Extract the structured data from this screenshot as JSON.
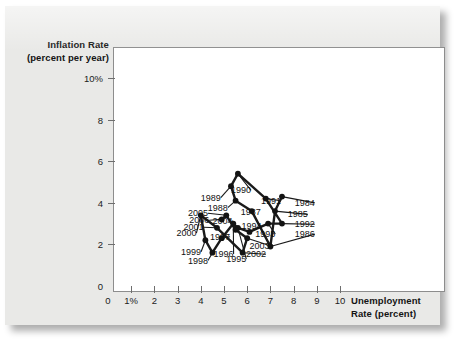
{
  "figure": {
    "name": "phillips-curve-scatter",
    "panel_color": "#e9e9e7",
    "plot_background": "#ffffff",
    "point_color": "#131313",
    "line_color": "#1a1a1a"
  },
  "chart_data": {
    "type": "scatter",
    "title": "",
    "xlabel_line1": "Unemployment",
    "xlabel_line2": "Rate (percent)",
    "ylabel_line1": "Inflation Rate",
    "ylabel_line2": "(percent per year)",
    "xlim": [
      0,
      10.6
    ],
    "ylim": [
      0,
      11.2
    ],
    "xticks": [
      0,
      1,
      2,
      3,
      4,
      5,
      6,
      7,
      8,
      9,
      10
    ],
    "xtick_labels": [
      "0",
      "1%",
      "2",
      "3",
      "4",
      "5",
      "6",
      "7",
      "8",
      "9",
      "10"
    ],
    "yticks": [
      0,
      2,
      4,
      6,
      8,
      10
    ],
    "ytick_labels": [
      "0",
      "2",
      "4",
      "6",
      "8",
      "10%"
    ],
    "grid": false,
    "legend": "none",
    "connected": true,
    "series": [
      {
        "name": "U.S. inflation vs unemployment 1984-2006",
        "points": [
          {
            "label": "1984",
            "x": 7.5,
            "y": 4.3,
            "lx": 8.05,
            "ly": 3.85,
            "anchor": "start"
          },
          {
            "label": "1985",
            "x": 7.2,
            "y": 3.6,
            "lx": 7.75,
            "ly": 3.3,
            "anchor": "start"
          },
          {
            "label": "1986",
            "x": 7.0,
            "y": 1.9,
            "lx": 8.05,
            "ly": 2.35,
            "anchor": "start"
          },
          {
            "label": "1987",
            "x": 6.2,
            "y": 3.6,
            "lx": 6.15,
            "ly": 3.4,
            "anchor": "middle"
          },
          {
            "label": "1988",
            "x": 5.5,
            "y": 4.1,
            "lx": 4.3,
            "ly": 3.62,
            "anchor": "start"
          },
          {
            "label": "1989",
            "x": 5.3,
            "y": 4.8,
            "lx": 4.0,
            "ly": 4.1,
            "anchor": "start"
          },
          {
            "label": "1990",
            "x": 5.6,
            "y": 5.4,
            "lx": 5.3,
            "ly": 4.45,
            "anchor": "start"
          },
          {
            "label": "1991",
            "x": 6.8,
            "y": 4.2,
            "lx": 6.6,
            "ly": 3.95,
            "anchor": "start"
          },
          {
            "label": "1992",
            "x": 7.5,
            "y": 3.0,
            "lx": 8.05,
            "ly": 2.82,
            "anchor": "start"
          },
          {
            "label": "1993",
            "x": 6.9,
            "y": 3.0,
            "lx": 6.35,
            "ly": 2.35,
            "anchor": "start"
          },
          {
            "label": "1994",
            "x": 6.1,
            "y": 2.6,
            "lx": 5.75,
            "ly": 2.75,
            "anchor": "start"
          },
          {
            "label": "1995",
            "x": 5.6,
            "y": 2.8,
            "lx": 5.1,
            "ly": 1.15,
            "anchor": "start"
          },
          {
            "label": "1996",
            "x": 5.4,
            "y": 3.0,
            "lx": 4.55,
            "ly": 1.4,
            "anchor": "start"
          },
          {
            "label": "1997",
            "x": 4.9,
            "y": 2.3,
            "lx": 4.4,
            "ly": 2.22,
            "anchor": "start"
          },
          {
            "label": "1998",
            "x": 4.5,
            "y": 1.6,
            "lx": 3.45,
            "ly": 1.08,
            "anchor": "start"
          },
          {
            "label": "1999",
            "x": 4.2,
            "y": 2.2,
            "lx": 3.15,
            "ly": 1.5,
            "anchor": "start"
          },
          {
            "label": "2000",
            "x": 4.0,
            "y": 3.4,
            "lx": 2.95,
            "ly": 2.4,
            "anchor": "start"
          },
          {
            "label": "2001",
            "x": 4.7,
            "y": 2.8,
            "lx": 3.25,
            "ly": 2.68,
            "anchor": "start"
          },
          {
            "label": "2002",
            "x": 5.8,
            "y": 1.6,
            "lx": 5.95,
            "ly": 1.38,
            "anchor": "start"
          },
          {
            "label": "2003",
            "x": 6.0,
            "y": 2.3,
            "lx": 6.1,
            "ly": 1.8,
            "anchor": "start"
          },
          {
            "label": "2004",
            "x": 5.5,
            "y": 2.7,
            "lx": 4.5,
            "ly": 3.0,
            "anchor": "start"
          },
          {
            "label": "2005",
            "x": 5.1,
            "y": 3.4,
            "lx": 3.45,
            "ly": 3.35,
            "anchor": "start"
          },
          {
            "label": "2006",
            "x": 4.9,
            "y": 3.2,
            "lx": 3.5,
            "ly": 3.02,
            "anchor": "start"
          }
        ]
      }
    ]
  }
}
